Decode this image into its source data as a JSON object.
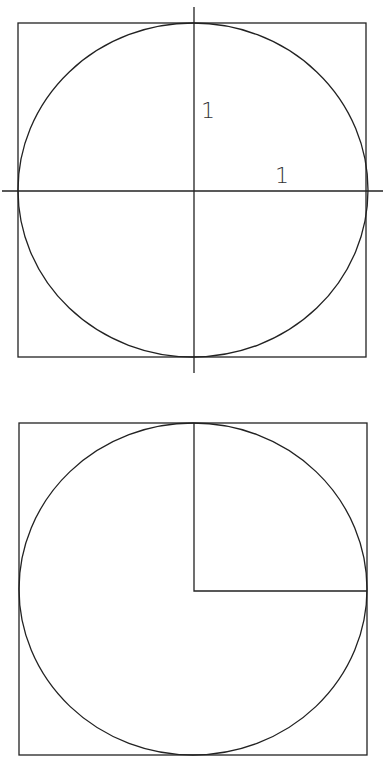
{
  "figures": [
    {
      "id": "unit-circle-with-axes",
      "labels": [
        {
          "text": "1",
          "meaning": "vertical radius label"
        },
        {
          "text": "1",
          "meaning": "horizontal radius label"
        }
      ]
    },
    {
      "id": "circle-with-quarter-square"
    }
  ],
  "colors": {
    "stroke": "#222222",
    "background": "#ffffff"
  }
}
